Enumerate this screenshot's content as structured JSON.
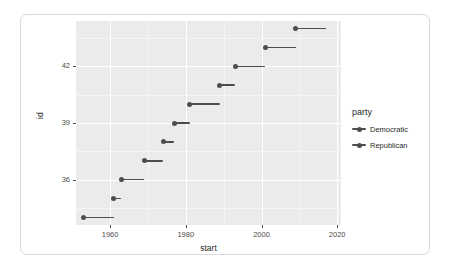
{
  "chart_data": {
    "type": "scatter",
    "title": "",
    "xlabel": "start",
    "ylabel": "id",
    "xlim": [
      1951,
      2021
    ],
    "ylim": [
      33.6,
      44.4
    ],
    "grid": true,
    "legend_position": "right",
    "legend_title": "party",
    "x_ticks": [
      "1960",
      "1980",
      "2000",
      "2020"
    ],
    "x_tick_values": [
      1960,
      1980,
      2000,
      2020
    ],
    "y_ticks": [
      "36",
      "39",
      "42"
    ],
    "y_tick_values": [
      36,
      39,
      42
    ],
    "series": [
      {
        "name": "Democratic",
        "color": "#4d4d4d"
      },
      {
        "name": "Republican",
        "color": "#4d4d4d"
      }
    ],
    "points": [
      {
        "id": 34,
        "start": 1953,
        "end": 1961,
        "party": "Republican"
      },
      {
        "id": 35,
        "start": 1961,
        "end": 1963,
        "party": "Democratic"
      },
      {
        "id": 36,
        "start": 1963,
        "end": 1969,
        "party": "Democratic"
      },
      {
        "id": 37,
        "start": 1969,
        "end": 1974,
        "party": "Republican"
      },
      {
        "id": 38,
        "start": 1974,
        "end": 1977,
        "party": "Republican"
      },
      {
        "id": 39,
        "start": 1977,
        "end": 1981,
        "party": "Democratic"
      },
      {
        "id": 40,
        "start": 1981,
        "end": 1989,
        "party": "Republican"
      },
      {
        "id": 41,
        "start": 1989,
        "end": 1993,
        "party": "Republican"
      },
      {
        "id": 42,
        "start": 1993,
        "end": 2001,
        "party": "Democratic"
      },
      {
        "id": 43,
        "start": 2001,
        "end": 2009,
        "party": "Republican"
      },
      {
        "id": 44,
        "start": 2009,
        "end": 2017,
        "party": "Democratic"
      }
    ]
  },
  "legend": {
    "title": "party",
    "items": [
      {
        "label": "Democratic",
        "color": "#4d4d4d"
      },
      {
        "label": "Republican",
        "color": "#4d4d4d"
      }
    ]
  },
  "axes": {
    "x_title": "start",
    "y_title": "id"
  },
  "theme": {
    "panel_background": "#ebebeb",
    "gridline_color": "#ffffff",
    "card_background": "#ffffff",
    "card_border": "#d9d9d9",
    "text_color": "#4d4d4d"
  }
}
